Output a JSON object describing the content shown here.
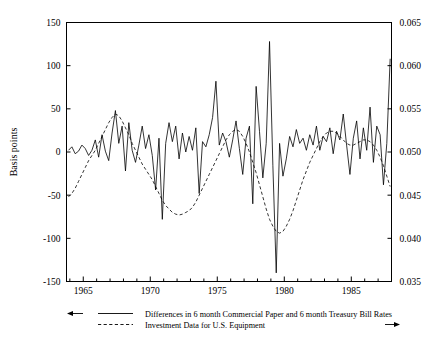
{
  "chart_data": {
    "type": "line",
    "title": "",
    "xlabel": "",
    "ylabel": "Basis points",
    "ylabel_right": "",
    "xlim": [
      1963.75,
      1988.0
    ],
    "ylim": [
      -150,
      150
    ],
    "ylim_right": [
      0.035,
      0.065
    ],
    "grid": false,
    "legend_position": "below-axes",
    "x_ticks_major": [
      1965,
      1970,
      1975,
      1980,
      1985
    ],
    "x_tick_labels": [
      "1965",
      "1970",
      "1975",
      "1980",
      "1985"
    ],
    "x_ticks_minor_step": 1,
    "y_ticks_left": [
      -150,
      -100,
      -50,
      0,
      50,
      100,
      150
    ],
    "y_tick_labels_left": [
      "-150",
      "-100",
      "-50",
      "0",
      "50",
      "100",
      "150"
    ],
    "y_ticks_right": [
      0.035,
      0.04,
      0.045,
      0.05,
      0.055,
      0.06,
      0.065
    ],
    "y_tick_labels_right": [
      "0.035",
      "0.040",
      "0.045",
      "0.050",
      "0.055",
      "0.060",
      "0.065"
    ],
    "axis_colors": {
      "line": "#000000",
      "text": "#000000",
      "background": "#ffffff"
    },
    "series": [
      {
        "name": "Differences in 6 month Commercial Paper and 6 month Treasury Bill Rates",
        "style": "solid",
        "axis": "left",
        "arrow": "left",
        "x_start": 1963.9,
        "x_step": 0.25,
        "values": [
          2,
          6,
          -2,
          1,
          8,
          4,
          -4,
          2,
          14,
          -6,
          20,
          1,
          -10,
          22,
          48,
          10,
          30,
          -22,
          34,
          2,
          -12,
          8,
          30,
          4,
          20,
          -4,
          -44,
          16,
          -78,
          10,
          34,
          12,
          30,
          -8,
          22,
          0,
          18,
          2,
          28,
          -48,
          12,
          6,
          20,
          40,
          82,
          8,
          22,
          12,
          -6,
          14,
          36,
          4,
          -26,
          16,
          30,
          -60,
          76,
          24,
          -30,
          10,
          128,
          -16,
          -140,
          10,
          -28,
          -8,
          18,
          6,
          26,
          10,
          16,
          2,
          20,
          8,
          30,
          2,
          18,
          12,
          28,
          -2,
          24,
          14,
          44,
          8,
          -26,
          16,
          36,
          -8,
          28,
          2,
          52,
          -12,
          30,
          20,
          -38,
          10,
          108,
          -14,
          22,
          4,
          -12,
          10,
          44,
          -56,
          52,
          16,
          6,
          -34,
          22,
          10,
          44,
          2,
          16,
          24,
          12,
          6,
          30,
          4,
          -14,
          10,
          -52,
          14,
          26,
          4,
          30,
          8,
          -8,
          16,
          48,
          10,
          28,
          -6,
          38,
          16,
          54,
          2,
          24,
          -16,
          30,
          10,
          18,
          26,
          12,
          8,
          22,
          -6,
          18,
          28
        ]
      },
      {
        "name": "Investment Data for U.S. Equipment",
        "style": "dashed",
        "axis": "right",
        "arrow": "right",
        "x_start": 1963.9,
        "x_step": 0.25,
        "values": [
          -52,
          -48,
          -42,
          -34,
          -26,
          -18,
          -10,
          -4,
          2,
          10,
          18,
          26,
          34,
          40,
          44,
          42,
          36,
          28,
          20,
          10,
          2,
          -6,
          -14,
          -20,
          -26,
          -32,
          -40,
          -48,
          -56,
          -62,
          -66,
          -70,
          -72,
          -73,
          -72,
          -70,
          -68,
          -64,
          -58,
          -50,
          -42,
          -34,
          -26,
          -18,
          -10,
          -2,
          6,
          14,
          20,
          24,
          26,
          24,
          18,
          10,
          0,
          -12,
          -24,
          -38,
          -52,
          -66,
          -78,
          -86,
          -92,
          -94,
          -92,
          -86,
          -78,
          -68,
          -56,
          -44,
          -32,
          -22,
          -12,
          -4,
          4,
          12,
          18,
          22,
          24,
          24,
          22,
          18,
          14,
          10,
          8,
          8,
          10,
          12,
          14,
          14,
          12,
          8,
          2,
          -6,
          -16,
          -28,
          -40,
          -52,
          -60,
          -64,
          -66,
          -64,
          -60,
          -58,
          -58,
          -62,
          -68,
          -76,
          -86,
          -98,
          -110,
          -120,
          -128,
          -136,
          -142,
          -144,
          -140,
          -132,
          -122,
          -110,
          -96,
          -82,
          -68,
          -56,
          -46,
          -38,
          -32,
          -28,
          -26,
          -24,
          -22,
          -20,
          -20,
          -22,
          -24,
          -28,
          -32,
          -36,
          -38,
          -38,
          -36,
          -34,
          -34,
          -36,
          -40,
          -44,
          -48,
          -50
        ]
      }
    ],
    "legend": [
      {
        "label": "Differences in 6 month Commercial Paper and 6 month Treasury Bill Rates",
        "style": "solid",
        "arrow": "left-arrow"
      },
      {
        "label": "Investment Data for U.S. Equipment",
        "style": "dashed",
        "arrow": "right-arrow"
      }
    ]
  }
}
